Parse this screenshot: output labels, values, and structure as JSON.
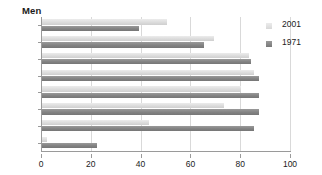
{
  "chart_data": {
    "type": "bar",
    "title": "Men",
    "orientation": "horizontal",
    "xlabel": "",
    "ylabel": "",
    "categories": [
      "85+",
      "75–84",
      "65–74",
      "55–64",
      "45–54",
      "35–44",
      "25–34",
      "16–24"
    ],
    "series": [
      {
        "name": "2001",
        "color": "#dcdcdc",
        "values": [
          50,
          69,
          83,
          85,
          80,
          73,
          43,
          2
        ]
      },
      {
        "name": "1971",
        "color": "#828282",
        "values": [
          39,
          65,
          84,
          87,
          87,
          87,
          85,
          22
        ]
      }
    ],
    "xlim": [
      0,
      100
    ],
    "xticks": [
      0,
      20,
      40,
      60,
      80,
      100
    ],
    "xtick_labels": [
      "0",
      "20",
      "40",
      "60",
      "80",
      "100"
    ],
    "grid": true,
    "grid_axis": "x",
    "legend_position": "right"
  },
  "legend": {
    "items": [
      {
        "label": "2001"
      },
      {
        "label": "1971"
      }
    ]
  }
}
